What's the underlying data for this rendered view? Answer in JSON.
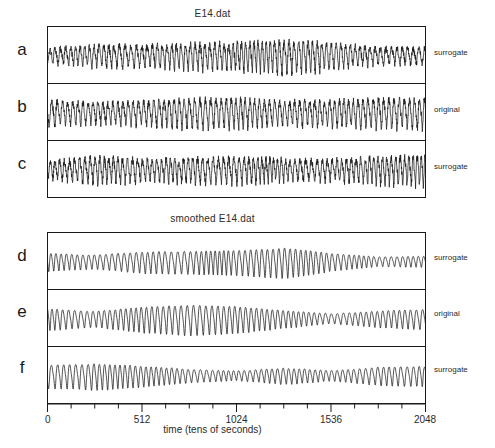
{
  "figure": {
    "background_color": "#ffffff",
    "line_color": "#1a1a1a"
  },
  "groups": [
    {
      "id": "upper",
      "title": "E14.dat",
      "panels": [
        {
          "letter": "a",
          "right_label": "surrogate"
        },
        {
          "letter": "b",
          "right_label": "original"
        },
        {
          "letter": "c",
          "right_label": "surrogate"
        }
      ]
    },
    {
      "id": "lower",
      "title": "smoothed E14.dat",
      "panels": [
        {
          "letter": "d",
          "right_label": "surrogate"
        },
        {
          "letter": "e",
          "right_label": "original"
        },
        {
          "letter": "f",
          "right_label": "surrogate"
        }
      ]
    }
  ],
  "xaxis": {
    "title": "time (tens of seconds)",
    "min": 0,
    "max": 2048,
    "major_ticks": [
      0,
      512,
      1024,
      1536,
      2048
    ],
    "major_tick_labels": [
      "0",
      "512",
      "1024",
      "1536",
      "2048"
    ],
    "minor_tick_step": 128
  },
  "chart_data": {
    "type": "line",
    "xlabel": "time (tens of seconds)",
    "ylabel": "",
    "xlim": [
      0,
      2048
    ],
    "grid": false,
    "legend": "right-side panel annotations",
    "panel_titles": [
      "E14.dat",
      "smoothed E14.dat"
    ],
    "series": [
      {
        "name": "a",
        "panel": "upper",
        "annotation": "surrogate",
        "description": "noisy quasi-periodic oscillation, dominant period ~26 time units, broadband noise, amplitude envelope grows toward x~1300 then decays after x~1750",
        "mean_period": 26,
        "noise_amplitude": 0.3,
        "envelope_x": [
          0,
          256,
          512,
          768,
          1024,
          1280,
          1536,
          1792,
          2048
        ],
        "envelope_y": [
          0.62,
          0.7,
          0.66,
          0.78,
          0.84,
          1.0,
          0.8,
          0.48,
          0.52
        ]
      },
      {
        "name": "b",
        "panel": "upper",
        "annotation": "original",
        "description": "noisy quasi-periodic oscillation, dominant period ~27 time units, strong burst near x~1100, flatter tail",
        "mean_period": 27,
        "noise_amplitude": 0.28,
        "envelope_x": [
          0,
          256,
          512,
          768,
          1024,
          1280,
          1536,
          1792,
          2048
        ],
        "envelope_y": [
          0.78,
          0.66,
          0.72,
          0.88,
          1.0,
          0.72,
          0.66,
          0.74,
          0.8
        ]
      },
      {
        "name": "c",
        "panel": "upper",
        "annotation": "surrogate",
        "description": "noisy quasi-periodic oscillation, dominant period ~26 time units, isolated large spike near x~330",
        "mean_period": 26,
        "noise_amplitude": 0.31,
        "envelope_x": [
          0,
          256,
          512,
          768,
          1024,
          1280,
          1536,
          1792,
          2048
        ],
        "envelope_y": [
          0.68,
          0.92,
          0.7,
          0.74,
          0.8,
          0.66,
          0.62,
          0.78,
          0.86
        ]
      },
      {
        "name": "d",
        "panel": "lower",
        "annotation": "surrogate",
        "description": "low-pass smoothed oscillation, dominant period ~30 time units, amplitude grows to maximum near x~1250 then falls to a quiet tail",
        "mean_period": 30,
        "noise_amplitude": 0.04,
        "envelope_x": [
          0,
          256,
          512,
          768,
          1024,
          1280,
          1536,
          1792,
          2048
        ],
        "envelope_y": [
          0.48,
          0.42,
          0.62,
          0.7,
          0.86,
          1.0,
          0.56,
          0.3,
          0.34
        ]
      },
      {
        "name": "e",
        "panel": "lower",
        "annotation": "original",
        "description": "low-pass smoothed oscillation, dominant period ~31 time units, strongest amplitude between x~600 and x~1200, quiet around x~1550",
        "mean_period": 31,
        "noise_amplitude": 0.04,
        "envelope_x": [
          0,
          256,
          512,
          768,
          1024,
          1280,
          1536,
          1792,
          2048
        ],
        "envelope_y": [
          0.58,
          0.5,
          0.82,
          1.0,
          0.9,
          0.62,
          0.34,
          0.58,
          0.7
        ]
      },
      {
        "name": "f",
        "panel": "lower",
        "annotation": "surrogate",
        "description": "low-pass smoothed oscillation, dominant period ~30 time units, strong early burst near x~250, quiet mid-section near x~1100, revival after x~1600",
        "mean_period": 30,
        "noise_amplitude": 0.04,
        "envelope_x": [
          0,
          256,
          512,
          768,
          1024,
          1280,
          1536,
          1792,
          2048
        ],
        "envelope_y": [
          0.62,
          0.96,
          0.66,
          0.42,
          0.34,
          0.54,
          0.4,
          0.82,
          0.88
        ]
      }
    ]
  }
}
